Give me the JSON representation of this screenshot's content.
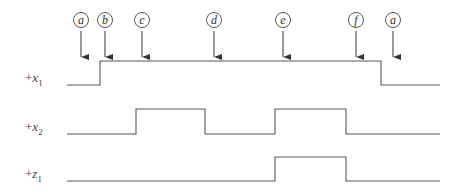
{
  "markers": [
    {
      "label": "a",
      "x": 81
    },
    {
      "label": "b",
      "x": 105
    },
    {
      "label": "c",
      "x": 142
    },
    {
      "label": "d",
      "x": 214
    },
    {
      "label": "e",
      "x": 283
    },
    {
      "label": "f",
      "x": 356
    },
    {
      "label": "a",
      "x": 393
    }
  ],
  "signals": [
    {
      "name": "x",
      "sub": "1",
      "prefix": "+",
      "low_y": 85,
      "high_y": 61,
      "points": "67,85 100,85 100,61 381,61 381,85 440,85"
    },
    {
      "name": "x",
      "sub": "2",
      "prefix": "+",
      "low_y": 134,
      "high_y": 109,
      "points": "67,134 136,134 136,109 205,109 205,134 275,134 275,109 346,109 346,134 440,134"
    },
    {
      "name": "z",
      "sub": "1",
      "prefix": "+",
      "low_y": 181,
      "high_y": 157,
      "points": "67,181 275,181 275,157 346,157 346,181 440,181"
    }
  ],
  "colors": {
    "line": "#555555",
    "text": "#333333"
  }
}
